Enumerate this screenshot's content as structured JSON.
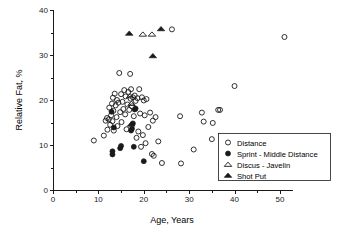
{
  "chart_data": {
    "type": "scatter",
    "title": "",
    "xlabel": "Age, Years",
    "ylabel": "Relative Fat, %",
    "xlim": [
      0,
      52
    ],
    "ylim": [
      0,
      40
    ],
    "xticks": [
      0,
      10,
      20,
      30,
      40,
      50
    ],
    "xtick_labels": [
      "0",
      "10",
      "20",
      "30",
      "40",
      "50"
    ],
    "xminor_ticks": [
      5,
      15,
      25,
      35,
      45
    ],
    "yticks": [
      0,
      10,
      20,
      30,
      40
    ],
    "ytick_labels": [
      "0",
      "10",
      "20",
      "30",
      "40"
    ],
    "yminor_ticks": [
      5,
      15,
      25,
      35
    ],
    "grid": false,
    "legend_position": "lower-right",
    "series": [
      {
        "name": "Distance",
        "marker": "open-circle",
        "color": "#1a1a1a",
        "points": [
          [
            9.0,
            11.0
          ],
          [
            11.2,
            12.1
          ],
          [
            11.6,
            15.4
          ],
          [
            11.9,
            16.0
          ],
          [
            12.0,
            13.4
          ],
          [
            12.3,
            15.7
          ],
          [
            12.4,
            18.3
          ],
          [
            12.6,
            14.5
          ],
          [
            12.8,
            16.6
          ],
          [
            13.0,
            19.2
          ],
          [
            13.1,
            15.3
          ],
          [
            13.2,
            20.5
          ],
          [
            13.3,
            17.6
          ],
          [
            13.4,
            13.2
          ],
          [
            13.6,
            21.4
          ],
          [
            13.8,
            18.8
          ],
          [
            14.0,
            16.2
          ],
          [
            14.1,
            20.0
          ],
          [
            14.2,
            14.2
          ],
          [
            14.4,
            19.4
          ],
          [
            14.6,
            26.0
          ],
          [
            14.8,
            17.3
          ],
          [
            15.0,
            21.3
          ],
          [
            15.1,
            15.1
          ],
          [
            15.3,
            19.6
          ],
          [
            15.5,
            18.0
          ],
          [
            15.7,
            22.2
          ],
          [
            15.9,
            16.8
          ],
          [
            16.0,
            20.8
          ],
          [
            16.2,
            13.5
          ],
          [
            16.4,
            19.0
          ],
          [
            16.6,
            21.8
          ],
          [
            16.8,
            17.8
          ],
          [
            17.0,
            25.8
          ],
          [
            17.1,
            20.3
          ],
          [
            17.2,
            22.4
          ],
          [
            17.4,
            18.6
          ],
          [
            17.6,
            20.6
          ],
          [
            17.8,
            16.4
          ],
          [
            18.0,
            21.0
          ],
          [
            18.2,
            19.8
          ],
          [
            18.4,
            11.6
          ],
          [
            18.6,
            20.4
          ],
          [
            18.8,
            13.0
          ],
          [
            19.0,
            22.4
          ],
          [
            19.2,
            17.0
          ],
          [
            19.4,
            9.6
          ],
          [
            19.6,
            20.6
          ],
          [
            19.8,
            12.2
          ],
          [
            20.0,
            19.9
          ],
          [
            20.2,
            16.6
          ],
          [
            20.4,
            10.4
          ],
          [
            20.6,
            20.2
          ],
          [
            21.0,
            14.0
          ],
          [
            21.4,
            17.2
          ],
          [
            21.8,
            8.0
          ],
          [
            22.0,
            15.4
          ],
          [
            22.2,
            7.6
          ],
          [
            22.6,
            16.2
          ],
          [
            23.2,
            10.8
          ],
          [
            24.0,
            6.0
          ],
          [
            26.2,
            35.7
          ],
          [
            28.0,
            16.4
          ],
          [
            28.2,
            5.9
          ],
          [
            31.0,
            9.0
          ],
          [
            32.8,
            17.2
          ],
          [
            33.2,
            15.2
          ],
          [
            35.0,
            11.3
          ],
          [
            35.2,
            14.9
          ],
          [
            36.4,
            17.8
          ],
          [
            36.8,
            17.8
          ],
          [
            40.0,
            23.1
          ],
          [
            51.0,
            34.0
          ]
        ]
      },
      {
        "name": "Sprint - Middle Distance",
        "marker": "filled-circle",
        "color": "#1a1a1a",
        "points": [
          [
            12.9,
            17.4
          ],
          [
            13.1,
            7.9
          ],
          [
            13.1,
            8.6
          ],
          [
            13.4,
            13.9
          ],
          [
            14.8,
            9.3
          ],
          [
            15.0,
            9.8
          ],
          [
            17.2,
            13.2
          ],
          [
            17.4,
            13.6
          ],
          [
            17.6,
            14.8
          ],
          [
            17.8,
            9.6
          ],
          [
            18.0,
            17.9
          ],
          [
            18.2,
            18.1
          ],
          [
            20.0,
            6.4
          ]
        ]
      },
      {
        "name": "Discus - Javelin",
        "marker": "open-triangle",
        "color": "#1a1a1a",
        "points": [
          [
            17.0,
            20.9
          ],
          [
            17.3,
            19.2
          ],
          [
            19.8,
            34.6
          ],
          [
            21.8,
            34.6
          ]
        ]
      },
      {
        "name": "Shot Put",
        "marker": "filled-triangle",
        "color": "#1a1a1a",
        "points": [
          [
            17.2,
            14.6
          ],
          [
            16.8,
            34.8
          ],
          [
            22.0,
            29.8
          ],
          [
            23.8,
            35.8
          ]
        ]
      }
    ]
  },
  "legend": {
    "entries": [
      {
        "label": "Distance",
        "marker": "open-circle"
      },
      {
        "label": "Sprint - Middle Distance",
        "marker": "filled-circle"
      },
      {
        "label": "Discus - Javelin",
        "marker": "open-triangle"
      },
      {
        "label": "Shot Put",
        "marker": "filled-triangle"
      }
    ]
  }
}
